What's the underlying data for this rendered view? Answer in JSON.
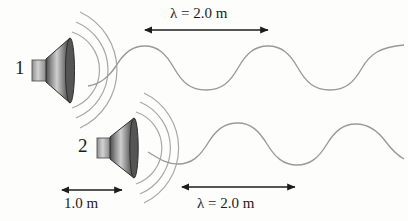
{
  "figure": {
    "background_color": "#fdfdfc",
    "ink_color": "#1c1c1c",
    "wave_color": "#9a9a9a",
    "speaker_cone_dark": "#3a3a3a",
    "speaker_cone_light": "#d8d8d8",
    "speaker_magnet_color": "#b4b4b4"
  },
  "speakers": [
    {
      "id": "speaker-1",
      "label": "1",
      "cone_x": 52,
      "cone_y": 70,
      "arc_count": 3
    },
    {
      "id": "speaker-2",
      "label": "2",
      "cone_x": 116,
      "cone_y": 148,
      "arc_count": 3
    }
  ],
  "dimensions": [
    {
      "id": "lambda-top",
      "text": "λ = 2.0 m",
      "value": 2.0,
      "unit": "m",
      "symbol": "λ",
      "arrow_x1": 145,
      "arrow_x2": 268,
      "arrow_y": 30,
      "label_position": "above"
    },
    {
      "id": "separation-bottom",
      "text": "1.0 m",
      "value": 1.0,
      "unit": "m",
      "symbol": "",
      "arrow_x1": 62,
      "arrow_x2": 122,
      "arrow_y": 190,
      "label_position": "below"
    },
    {
      "id": "lambda-bottom",
      "text": "λ = 2.0 m",
      "value": 2.0,
      "unit": "m",
      "symbol": "λ",
      "arrow_x1": 182,
      "arrow_x2": 295,
      "arrow_y": 187,
      "label_position": "below"
    }
  ],
  "waves": [
    {
      "id": "wave-top",
      "source": "speaker-1",
      "baseline_y": 70,
      "amplitude": 22,
      "wavelength_px": 123,
      "x_start": 110,
      "x_end": 404
    },
    {
      "id": "wave-bottom",
      "source": "speaker-2",
      "baseline_y": 148,
      "amplitude": 20,
      "wavelength_px": 113,
      "x_start": 170,
      "x_end": 404
    }
  ]
}
